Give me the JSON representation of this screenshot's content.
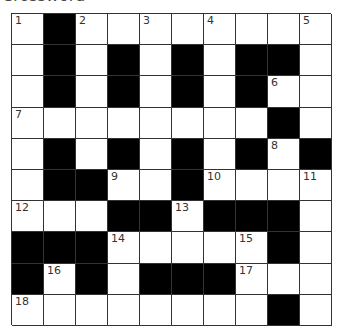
{
  "title": "Crossword",
  "grid": {
    "rows": 10,
    "cols": 10,
    "layout": [
      "W#WWWWWWWW",
      "W#W#W#W##W",
      "W#W#W#W#WW",
      "WWWWWWWW#W",
      "W#W#W#W#W#",
      "W##WW#WWWW",
      "WWW##W###W",
      "###WWWWW#W",
      "#W#W###WWW",
      "WWWWWWWW#W"
    ],
    "numbers": [
      {
        "row": 0,
        "col": 0,
        "n": "1"
      },
      {
        "row": 0,
        "col": 2,
        "n": "2"
      },
      {
        "row": 0,
        "col": 4,
        "n": "3"
      },
      {
        "row": 0,
        "col": 6,
        "n": "4"
      },
      {
        "row": 0,
        "col": 9,
        "n": "5"
      },
      {
        "row": 2,
        "col": 8,
        "n": "6"
      },
      {
        "row": 3,
        "col": 0,
        "n": "7"
      },
      {
        "row": 4,
        "col": 8,
        "n": "8"
      },
      {
        "row": 5,
        "col": 3,
        "n": "9"
      },
      {
        "row": 5,
        "col": 6,
        "n": "10"
      },
      {
        "row": 5,
        "col": 9,
        "n": "11"
      },
      {
        "row": 6,
        "col": 0,
        "n": "12"
      },
      {
        "row": 6,
        "col": 5,
        "n": "13"
      },
      {
        "row": 7,
        "col": 3,
        "n": "14"
      },
      {
        "row": 7,
        "col": 7,
        "n": "15"
      },
      {
        "row": 8,
        "col": 1,
        "n": "16"
      },
      {
        "row": 8,
        "col": 7,
        "n": "17"
      },
      {
        "row": 9,
        "col": 0,
        "n": "18"
      }
    ]
  }
}
